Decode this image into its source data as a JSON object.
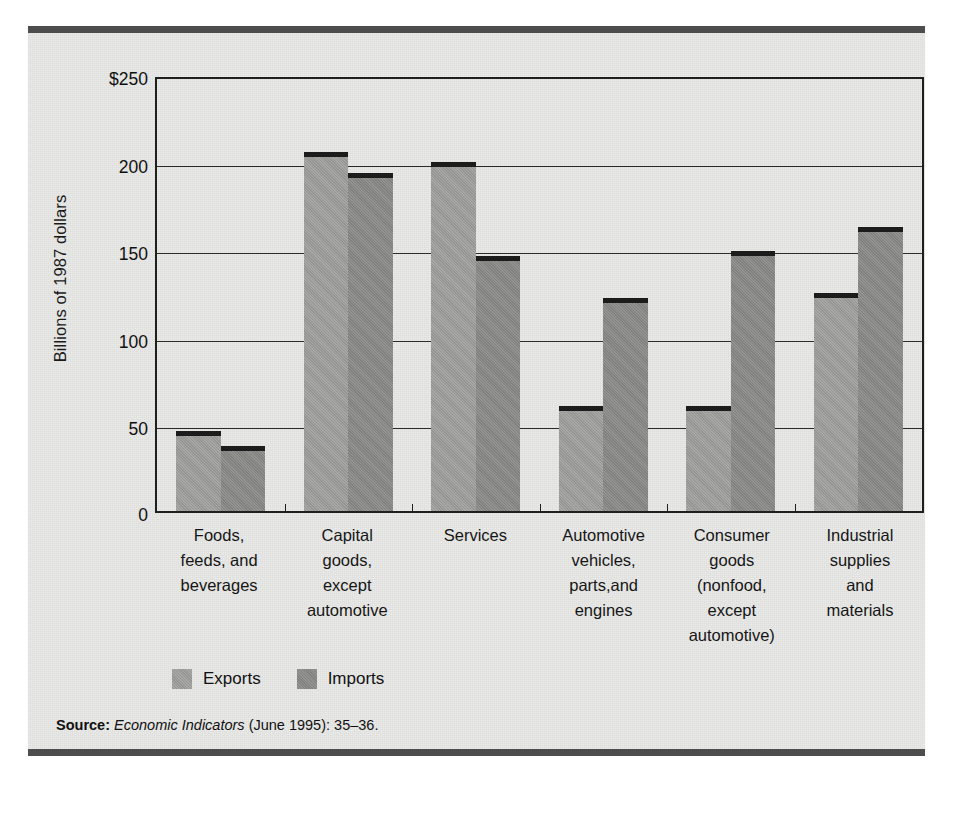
{
  "figure": {
    "source_prefix": "Source:",
    "source_italic": "Economic Indicators",
    "source_rest": "(June 1995): 35–36."
  },
  "chart_data": {
    "type": "bar",
    "title": "",
    "subtitle": "",
    "xlabel": "",
    "ylabel": "Billions of 1987 dollars",
    "ylim": [
      0,
      250
    ],
    "yticks": [
      0,
      50,
      100,
      150,
      200,
      250
    ],
    "ytick_labels": [
      "0",
      "50",
      "100",
      "150",
      "200",
      "$250"
    ],
    "grid": true,
    "legend_position": "below-left",
    "categories": [
      "Foods,\nfeeds, and\nbeverages",
      "Capital\ngoods,\nexcept\nautomotive",
      "Services",
      "Automotive\nvehicles,\nparts,and\nengines",
      "Consumer\ngoods\n(nonfood,\nexcept\nautomotive)",
      "Industrial\nsupplies\nand\nmaterials"
    ],
    "category_lines": [
      [
        "Foods,",
        "feeds, and",
        "beverages"
      ],
      [
        "Capital",
        "goods,",
        "except",
        "automotive"
      ],
      [
        "Services"
      ],
      [
        "Automotive",
        "vehicles,",
        "parts,and",
        "engines"
      ],
      [
        "Consumer",
        "goods",
        "(nonfood,",
        "except",
        "automotive)"
      ],
      [
        "Industrial",
        "supplies",
        "and",
        "materials"
      ]
    ],
    "series": [
      {
        "name": "Exports",
        "color": "#9d9d9b",
        "values": [
          46,
          206,
          200,
          60,
          60,
          125
        ]
      },
      {
        "name": "Imports",
        "color": "#8b8b89",
        "values": [
          37,
          194,
          146,
          122,
          149,
          163
        ]
      }
    ]
  }
}
